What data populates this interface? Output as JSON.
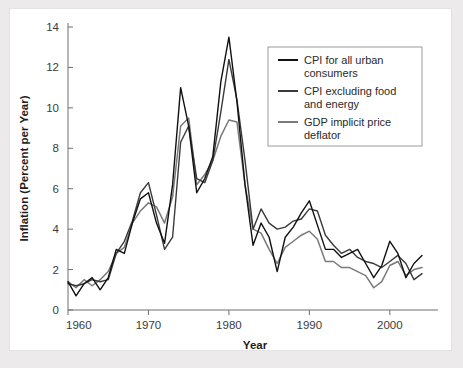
{
  "figure": {
    "background_color": "#eceaea",
    "card_color": "#ffffff"
  },
  "chart_data": {
    "type": "line",
    "title": "",
    "xlabel": "Year",
    "ylabel": "Inflation (Percent per Year)",
    "xlim": [
      1960,
      2004
    ],
    "ylim": [
      0,
      14
    ],
    "xticks": [
      1960,
      1970,
      1980,
      1990,
      2000
    ],
    "xtick_labels": [
      "1960",
      "1970",
      "1980",
      "1990",
      "2000"
    ],
    "yticks": [
      0,
      2,
      4,
      6,
      8,
      10,
      12,
      14
    ],
    "ytick_labels": [
      "0",
      "2",
      "4",
      "6",
      "8",
      "10",
      "12",
      "14"
    ],
    "grid": false,
    "legend_position": "upper right",
    "x": [
      1960,
      1961,
      1962,
      1963,
      1964,
      1965,
      1966,
      1967,
      1968,
      1969,
      1970,
      1971,
      1972,
      1973,
      1974,
      1975,
      1976,
      1977,
      1978,
      1979,
      1980,
      1981,
      1982,
      1983,
      1984,
      1985,
      1986,
      1987,
      1988,
      1989,
      1990,
      1991,
      1992,
      1993,
      1994,
      1995,
      1996,
      1997,
      1998,
      1999,
      2000,
      2001,
      2002,
      2003,
      2004
    ],
    "series": [
      {
        "name": "CPI for all urban consumers",
        "color": "#111111",
        "values": [
          1.4,
          0.7,
          1.3,
          1.6,
          1.0,
          1.6,
          3.0,
          2.8,
          4.3,
          5.5,
          5.8,
          4.3,
          3.3,
          6.2,
          11.0,
          9.1,
          5.8,
          6.5,
          7.6,
          11.3,
          13.5,
          10.3,
          6.2,
          3.2,
          4.3,
          3.6,
          1.9,
          3.6,
          4.1,
          4.8,
          5.4,
          4.2,
          3.0,
          3.0,
          2.6,
          2.8,
          3.0,
          2.3,
          1.6,
          2.2,
          3.4,
          2.8,
          1.6,
          2.3,
          2.7
        ]
      },
      {
        "name": "CPI excluding food and energy",
        "color": "#3a3a3a",
        "values": [
          1.3,
          1.2,
          1.3,
          1.5,
          1.4,
          1.5,
          2.8,
          3.4,
          4.4,
          5.8,
          6.3,
          4.7,
          3.0,
          3.6,
          8.3,
          9.1,
          6.5,
          6.3,
          7.4,
          9.8,
          12.4,
          10.4,
          7.4,
          4.0,
          5.0,
          4.3,
          4.0,
          4.1,
          4.4,
          4.5,
          5.0,
          4.9,
          3.7,
          3.2,
          2.8,
          3.0,
          2.6,
          2.4,
          2.3,
          2.1,
          2.4,
          2.7,
          2.3,
          1.5,
          1.8
        ]
      },
      {
        "name": "GDP implicit price deflator",
        "color": "#7a7a7a",
        "values": [
          1.4,
          1.1,
          1.5,
          1.2,
          1.5,
          1.9,
          2.8,
          3.1,
          4.3,
          4.9,
          5.3,
          5.1,
          4.3,
          5.6,
          9.1,
          9.5,
          6.2,
          6.7,
          7.4,
          8.6,
          9.4,
          9.3,
          6.2,
          4.0,
          3.8,
          3.0,
          2.3,
          3.1,
          3.4,
          3.7,
          3.9,
          3.5,
          2.4,
          2.4,
          2.1,
          2.1,
          1.9,
          1.7,
          1.1,
          1.4,
          2.2,
          2.4,
          1.7,
          2.0,
          2.1
        ]
      }
    ]
  }
}
